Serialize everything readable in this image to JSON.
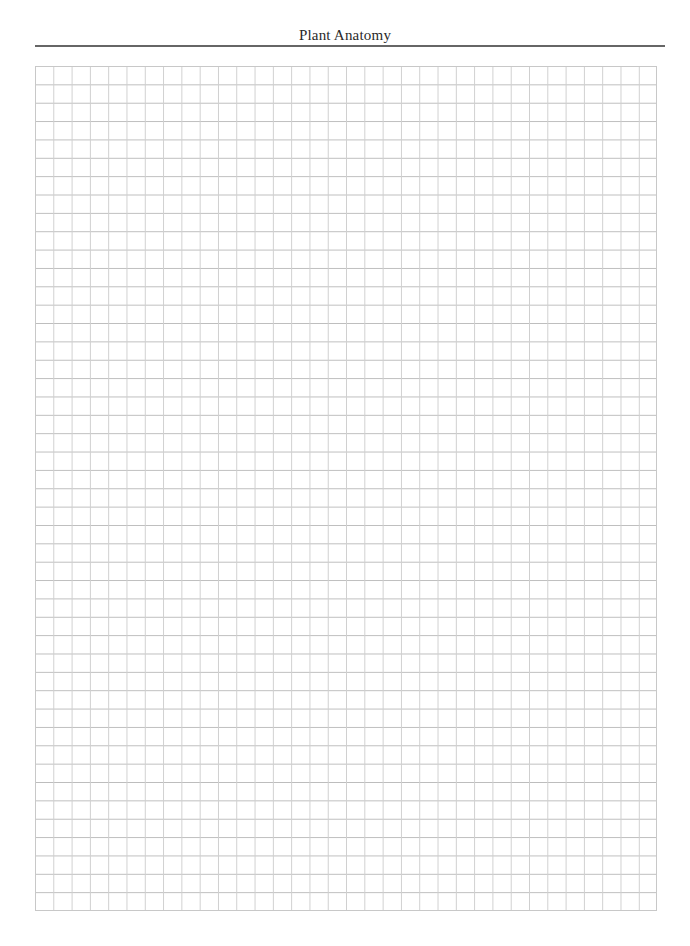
{
  "header": {
    "title": "Plant Anatomy"
  },
  "grid": {
    "columns": 34,
    "rows": 46,
    "line_color": "#c8c8c8",
    "background": "#ffffff"
  }
}
